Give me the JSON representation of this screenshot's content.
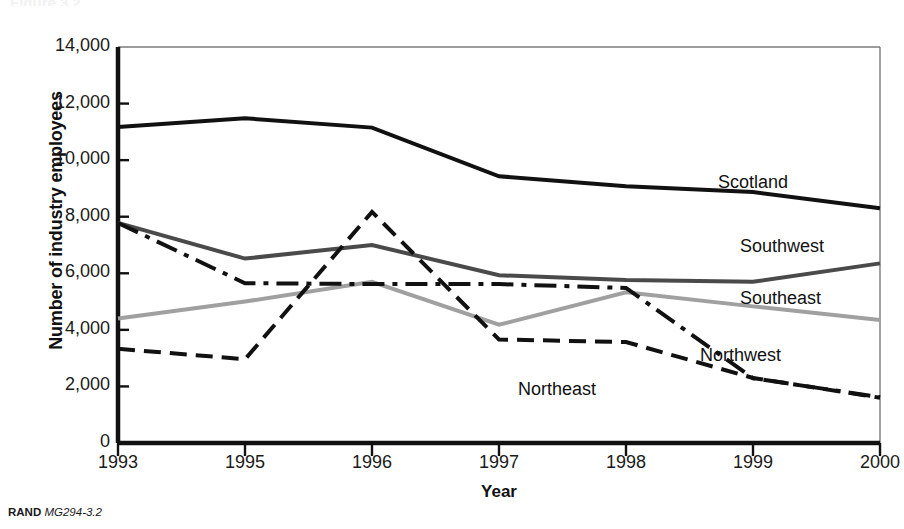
{
  "figure": {
    "credit_org": "RAND",
    "credit_id": "MG294-3.2",
    "title_cut_off": "Figure 3.2"
  },
  "chart_data": {
    "type": "line",
    "title": "",
    "xlabel": "Year",
    "ylabel": "Number of industry employees",
    "categories": [
      "1993",
      "1995",
      "1996",
      "1997",
      "1998",
      "1999",
      "2000"
    ],
    "x": [
      1993,
      1995,
      1996,
      1997,
      1998,
      1999,
      2000
    ],
    "xlim": [
      1993,
      2000
    ],
    "ylim": [
      0,
      14000
    ],
    "yticks": [
      0,
      2000,
      4000,
      6000,
      8000,
      10000,
      12000,
      14000
    ],
    "ytick_labels": [
      "0",
      "2,000",
      "4,000",
      "6,000",
      "8,000",
      "10,000",
      "12,000",
      "14,000"
    ],
    "grid": false,
    "legend_position": "right-inline-end-labels",
    "series": [
      {
        "name": "Scotland",
        "values": [
          11170,
          11480,
          11150,
          9430,
          9080,
          8870,
          8300
        ],
        "color": "#111111",
        "style": "solid",
        "width": 4
      },
      {
        "name": "Southwest",
        "values": [
          7780,
          6520,
          7000,
          5930,
          5760,
          5700,
          6350
        ],
        "color": "#4a4a4a",
        "style": "solid",
        "width": 4
      },
      {
        "name": "Southeast",
        "values": [
          4400,
          5000,
          5700,
          4180,
          5330,
          4830,
          4350
        ],
        "color": "#a0a0a0",
        "style": "solid",
        "width": 4
      },
      {
        "name": "Northwest",
        "values": [
          7780,
          5650,
          5620,
          5620,
          5480,
          2290,
          1620
        ],
        "color": "#111111",
        "style": "dashdot",
        "width": 4
      },
      {
        "name": "Northeast",
        "values": [
          3330,
          2960,
          8170,
          3660,
          3570,
          2300,
          1600
        ],
        "color": "#111111",
        "style": "dashed",
        "width": 4
      }
    ],
    "end_labels": [
      {
        "text": "Scotland",
        "x": 718,
        "y": 172
      },
      {
        "text": "Southwest",
        "x": 740,
        "y": 236
      },
      {
        "text": "Southeast",
        "x": 740,
        "y": 288
      },
      {
        "text": "Northwest",
        "x": 700,
        "y": 345
      },
      {
        "text": "Northeast",
        "x": 518,
        "y": 379
      }
    ]
  }
}
